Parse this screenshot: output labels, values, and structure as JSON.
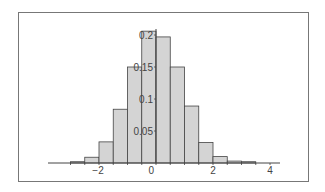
{
  "chart_data": {
    "type": "bar",
    "subtype": "histogram",
    "title": "",
    "xlabel": "",
    "ylabel": "",
    "bin_edges": [
      -3.0,
      -2.5,
      -2.0,
      -1.5,
      -1.0,
      -0.5,
      0.0,
      0.5,
      1.0,
      1.5,
      2.0,
      2.5,
      3.0,
      3.5
    ],
    "categories": [
      "-3.0 to -2.5",
      "-2.5 to -2.0",
      "-2.0 to -1.5",
      "-1.5 to -1.0",
      "-1.0 to -0.5",
      "-0.5 to 0.0",
      "0.0 to 0.5",
      "0.5 to 1.0",
      "1.0 to 1.5",
      "1.5 to 2.0",
      "2.0 to 2.5",
      "2.5 to 3.0",
      "3.0 to 3.5"
    ],
    "values": [
      0.002,
      0.009,
      0.033,
      0.084,
      0.15,
      0.206,
      0.197,
      0.15,
      0.089,
      0.032,
      0.01,
      0.003,
      0.002
    ],
    "xlim": [
      -3.2,
      4.3
    ],
    "ylim": [
      0,
      0.21
    ],
    "x_ticks": [
      -2,
      0,
      2,
      4
    ],
    "x_tick_labels": [
      "-2",
      "0",
      "2",
      "4"
    ],
    "y_ticks": [
      0.05,
      0.1,
      0.15,
      0.2
    ],
    "y_tick_labels": [
      "0.05",
      "0.1",
      "0.15",
      "0.2"
    ],
    "y_axis_position": "x=0",
    "grid": false,
    "legend": null,
    "bar_color": "#d4d4d4",
    "edge_color": "#444444"
  }
}
